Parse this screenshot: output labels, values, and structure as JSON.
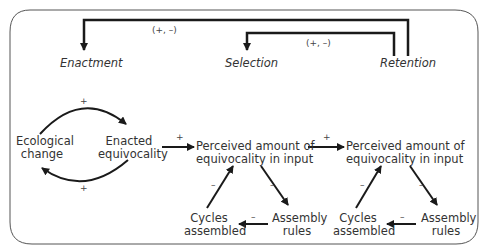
{
  "diagram": {
    "stages": {
      "enactment": "Enactment",
      "selection": "Selection",
      "retention": "Retention"
    },
    "feedback": {
      "outer": "(+, –)",
      "inner": "(+, –)"
    },
    "loop": {
      "ecological_change_1": "Ecological",
      "ecological_change_2": "change",
      "enacted_equivocality_1": "Enacted",
      "enacted_equivocality_2": "equivocality",
      "top_sign": "+",
      "bottom_sign": "+"
    },
    "arrow_signs": {
      "to_selection": "+",
      "to_retention": "+"
    },
    "triangles": [
      {
        "top_1": "Perceived amount of",
        "top_2": "equivocality in input",
        "left_1": "Cycles",
        "left_2": "assembled",
        "right_1": "Assembly",
        "right_2": "rules",
        "sign_left": "–",
        "sign_right": "–",
        "sign_bottom": "–"
      },
      {
        "top_1": "Perceived amount of",
        "top_2": "equivocality in input",
        "left_1": "Cycles",
        "left_2": "assembled",
        "right_1": "Assembly",
        "right_2": "rules",
        "sign_left": "–",
        "sign_right": "–",
        "sign_bottom": "–"
      }
    ]
  }
}
